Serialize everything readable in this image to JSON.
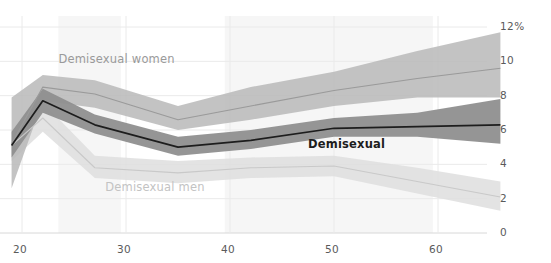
{
  "chart_data": {
    "type": "line",
    "title": "",
    "xlabel": "",
    "ylabel": "",
    "xlim": [
      19,
      66
    ],
    "ylim": [
      0,
      12.6
    ],
    "grid": true,
    "legend_position": "inline-annotations",
    "y_ticks": [
      0,
      2,
      4,
      6,
      8,
      10,
      12
    ],
    "y_tick_labels": [
      "0",
      "2",
      "4",
      "6",
      "8",
      "10",
      "12%"
    ],
    "x_ticks": [
      20,
      30,
      40,
      50,
      60
    ],
    "x_tick_labels": [
      "20",
      "30",
      "40",
      "50",
      "60"
    ],
    "x": [
      19,
      22,
      27,
      35,
      42,
      50,
      58,
      66
    ],
    "series": [
      {
        "name": "Demisexual women",
        "color": "#9a9a9a",
        "band_color": "#b9b9b9",
        "values": [
          5.2,
          8.5,
          8.1,
          6.6,
          7.4,
          8.3,
          9.0,
          9.6
        ],
        "band_low": [
          2.6,
          7.7,
          7.3,
          6.0,
          6.6,
          7.4,
          7.9,
          7.9
        ],
        "band_high": [
          7.9,
          9.2,
          8.9,
          7.4,
          8.5,
          9.4,
          10.6,
          11.7
        ],
        "label": "Demisexual women"
      },
      {
        "name": "Demisexual",
        "color": "#1d1d1d",
        "band_color": "#8f8f8f",
        "values": [
          5.1,
          7.7,
          6.3,
          5.0,
          5.4,
          6.1,
          6.2,
          6.3
        ],
        "band_low": [
          4.4,
          7.0,
          5.8,
          4.5,
          4.9,
          5.6,
          5.6,
          5.2
        ],
        "band_high": [
          5.9,
          8.4,
          6.9,
          5.6,
          6.0,
          6.7,
          7.0,
          7.8
        ],
        "label": "Demisexual"
      },
      {
        "name": "Demisexual men",
        "color": "#c9c9c9",
        "band_color": "#dedede",
        "values": [
          5.1,
          6.7,
          3.8,
          3.5,
          3.8,
          3.9,
          3.0,
          2.1
        ],
        "band_low": [
          4.2,
          5.9,
          3.2,
          2.9,
          3.2,
          3.3,
          2.3,
          1.3
        ],
        "band_high": [
          6.0,
          7.6,
          4.5,
          4.2,
          4.4,
          4.5,
          3.8,
          3.0
        ],
        "label": "Demisexual men"
      }
    ],
    "annotations": [
      {
        "text": "Demisexual women",
        "x": 23.5,
        "y": 10.1,
        "style": "women"
      },
      {
        "text": "Demisexual",
        "x": 47.5,
        "y": 5.1,
        "style": "mid"
      },
      {
        "text": "Demisexual men",
        "x": 28.0,
        "y": 2.6,
        "style": "men"
      }
    ],
    "shaded_columns": [
      {
        "x0": 23.5,
        "x1": 29.5
      },
      {
        "x0": 39.5,
        "x1": 49.5
      },
      {
        "x0": 49.5,
        "x1": 59.5
      }
    ],
    "colors": {
      "background": "#ffffff",
      "grid": "#eaeaea",
      "axis_text": "#5a5a5a",
      "column_shade": "#f6f6f6"
    }
  }
}
